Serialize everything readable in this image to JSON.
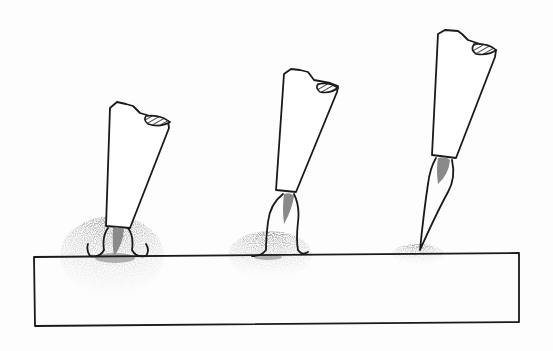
{
  "figure": {
    "colors": {
      "ink": "#1a1a1a",
      "core": "#8a8a8a",
      "background": "#fdfdfd",
      "stipple": "#777777"
    }
  },
  "workpiece": {
    "x1": 34,
    "y1": 256,
    "x2": 519,
    "y2": 253,
    "bottom_left": 326,
    "bottom_right": 322
  },
  "torches": [
    {
      "label": "torch-1",
      "flame": "short-spreading",
      "zone_cx": 110,
      "zone_rx": 50,
      "zone_ry": 36
    },
    {
      "label": "torch-2",
      "flame": "medium-bulb",
      "zone_cx": 270,
      "zone_rx": 42,
      "zone_ry": 22
    },
    {
      "label": "torch-3",
      "flame": "long-pointed",
      "zone_cx": 420,
      "zone_rx": 26,
      "zone_ry": 10
    }
  ]
}
